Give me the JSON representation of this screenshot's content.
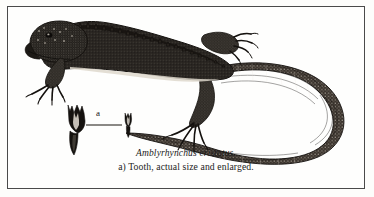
{
  "plate": {
    "kind": "engraved-plate-illustration",
    "frame_color": "#4a4a4a",
    "paper_color": "#fdfdfb",
    "ink_color": "#1a1a1a"
  },
  "figure": {
    "subject_common_name": "marine iguana",
    "subject_pose": "lateral view, head to upper left, tail curled to the right",
    "elements": [
      "iguana-body",
      "dorsal-crest",
      "front-foot",
      "hind-foot",
      "curled-tail",
      "tooth-enlarged",
      "tooth-actual-size",
      "callout-leader-line"
    ]
  },
  "callout": {
    "label": "a"
  },
  "caption": {
    "species": "Amblyrhynchus cristatus.",
    "note": "a) Tooth, actual size and enlarged."
  }
}
